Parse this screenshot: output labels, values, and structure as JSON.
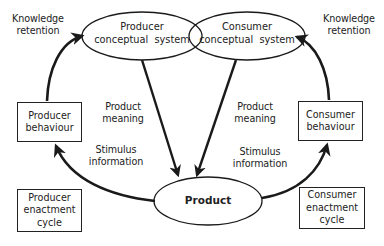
{
  "diagram": {
    "nodes": {
      "producer_conceptual": {
        "line1": "Producer",
        "line2": "conceptual  system"
      },
      "consumer_conceptual": {
        "line1": "Consumer",
        "line2": "conceptual  system"
      },
      "product": {
        "label": "Product"
      },
      "producer_behaviour": {
        "line1": "Producer",
        "line2": "behaviour"
      },
      "consumer_behaviour": {
        "line1": "Consumer",
        "line2": "behaviour"
      },
      "producer_enactment": {
        "line1": "Producer",
        "line2": "enactment",
        "line3": "cycle"
      },
      "consumer_enactment": {
        "line1": "Consumer",
        "line2": "enactment",
        "line3": "cycle"
      }
    },
    "edge_labels": {
      "left_knowledge": {
        "line1": "Knowledge",
        "line2": "retention"
      },
      "right_knowledge": {
        "line1": "Knowledge",
        "line2": "retention"
      },
      "left_meaning": {
        "line1": "Product",
        "line2": "meaning"
      },
      "right_meaning": {
        "line1": "Product",
        "line2": "meaning"
      },
      "left_stimulus": {
        "line1": "Stimulus",
        "line2": "information"
      },
      "right_stimulus": {
        "line1": "Stimulus",
        "line2": "information"
      }
    },
    "edges": [
      {
        "from": "producer_behaviour",
        "to": "producer_conceptual",
        "label": "Knowledge retention"
      },
      {
        "from": "consumer_behaviour",
        "to": "consumer_conceptual",
        "label": "Knowledge retention"
      },
      {
        "from": "producer_conceptual",
        "to": "product",
        "label": "Product meaning"
      },
      {
        "from": "consumer_conceptual",
        "to": "product",
        "label": "Product meaning"
      },
      {
        "from": "product",
        "to": "producer_behaviour",
        "label": "Stimulus information"
      },
      {
        "from": "product",
        "to": "consumer_behaviour",
        "label": "Stimulus information"
      }
    ],
    "stroke_color": "#1a1a1a",
    "background": "#ffffff"
  }
}
